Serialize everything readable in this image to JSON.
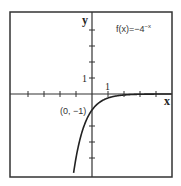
{
  "chart_data": {
    "type": "line",
    "function_label": "f(x)=−4",
    "function_exponent": "−x",
    "xlabel": "x",
    "ylabel": "y",
    "tick_label_x": "1",
    "tick_label_y": "1",
    "annotation": "(0, −1)",
    "annotated_point": {
      "x": 0,
      "y": -1
    },
    "xlim": [
      -5,
      5
    ],
    "ylim": [
      -5.2,
      5
    ],
    "x_ticks": [
      -4,
      -3,
      -2,
      -1,
      1,
      2,
      3,
      4
    ],
    "y_ticks": [
      -4,
      -3,
      -2,
      -1,
      1,
      2,
      3,
      4
    ],
    "grid": false,
    "series": [
      {
        "name": "f(x)=-4^-x",
        "x": [
          -1.15,
          -1,
          -0.5,
          0,
          0.5,
          1,
          2,
          3,
          4,
          5
        ],
        "y": [
          -4.92,
          -4,
          -2,
          -1,
          -0.5,
          -0.25,
          -0.0625,
          -0.0156,
          -0.0039,
          -0.001
        ]
      }
    ]
  }
}
